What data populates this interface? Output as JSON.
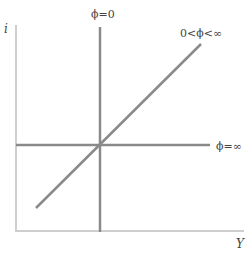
{
  "diagram": {
    "type": "IS-LM-style policy curves",
    "axes": {
      "y_label": "i",
      "x_label": "Y"
    },
    "curves": [
      {
        "id": "vertical",
        "label": "ϕ=0",
        "orientation": "vertical"
      },
      {
        "id": "diagonal",
        "label": "0<ϕ<∞",
        "orientation": "upward-sloping"
      },
      {
        "id": "horizontal",
        "label": "ϕ=∞",
        "orientation": "horizontal"
      }
    ],
    "colors": {
      "axis": "#cfcfcf",
      "curve": "#8a8a8a",
      "text": "#444444"
    }
  }
}
